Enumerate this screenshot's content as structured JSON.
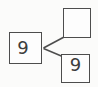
{
  "diagram": {
    "kind": "number-bond",
    "nodes": {
      "whole": {
        "value": "9"
      },
      "part_top": {
        "value": ""
      },
      "part_bottom": {
        "value": "9"
      }
    },
    "colors": {
      "line": "#4d4d4d",
      "box_fill": "#fdfdfd",
      "background": "#fbfbfa",
      "text": "#3d3d3d"
    }
  }
}
